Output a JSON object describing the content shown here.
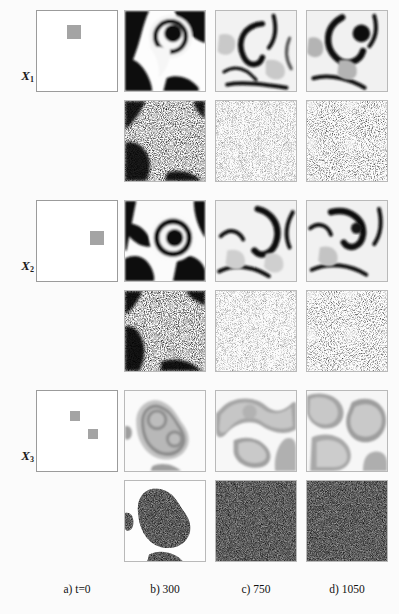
{
  "figure": {
    "type": "simulation-snapshot-grid",
    "background_color": "#fbfbfb",
    "seed_color": "#9c9c9c",
    "frame_color": "#9b9b9b"
  },
  "columns": [
    {
      "key": "a",
      "label": "a) t=0",
      "time": 0
    },
    {
      "key": "b",
      "label": "b) 300",
      "time": 300
    },
    {
      "key": "c",
      "label": "c) 750",
      "time": 750
    },
    {
      "key": "d",
      "label": "d) 1050",
      "time": 1050
    }
  ],
  "rows": [
    {
      "key": "X1",
      "label": "X",
      "subscript": "1",
      "initial_seeds": 1,
      "contrast": "high",
      "noise_style": "sparse-black-speckle"
    },
    {
      "key": "X2",
      "label": "X",
      "subscript": "2",
      "initial_seeds": 1,
      "contrast": "high",
      "noise_style": "sparse-black-speckle"
    },
    {
      "key": "X3",
      "label": "X",
      "subscript": "3",
      "initial_seeds": 2,
      "contrast": "low",
      "noise_style": "dense-gray-speckle"
    }
  ],
  "captions": {
    "a": "a) t=0",
    "b": "b) 300",
    "c": "c) 750",
    "d": "d) 1050"
  }
}
